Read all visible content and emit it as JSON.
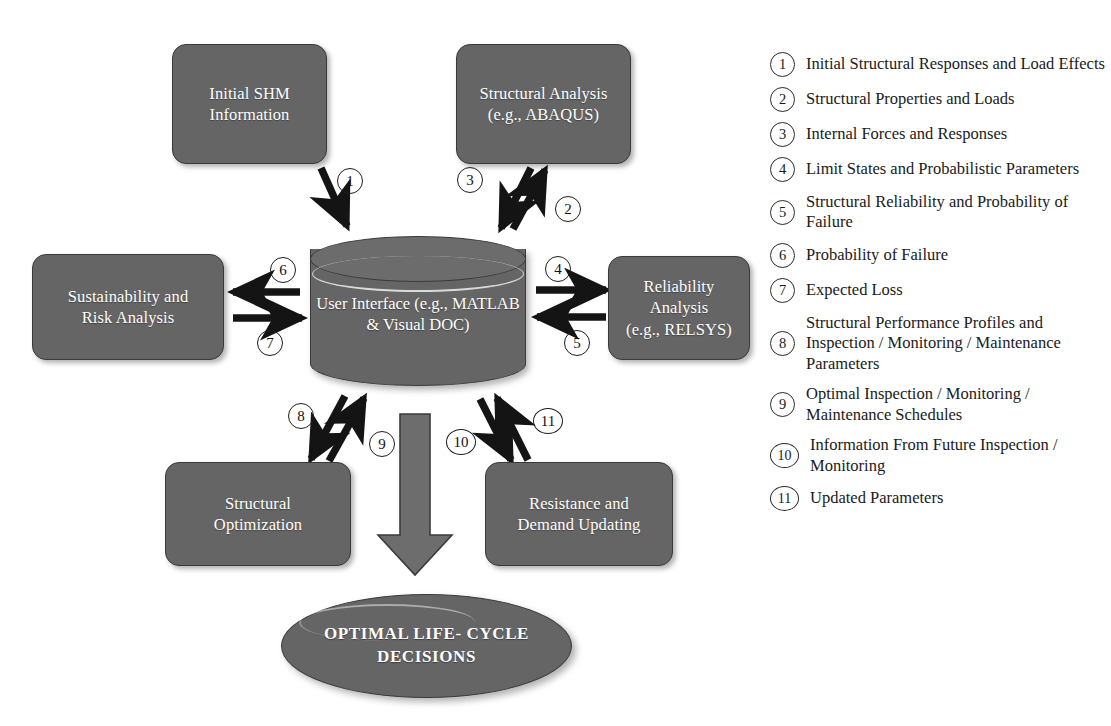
{
  "diagram": {
    "colors": {
      "box_fill": "#656565",
      "box_border": "#3a3a3a",
      "box_text": "#ffffff",
      "arrow": "#141414",
      "big_arrow_fill": "#6d6d6d",
      "legend_text": "#1a1a1a",
      "background": "#ffffff"
    },
    "nodes": [
      {
        "id": "initial-shm-information",
        "shape": "rounded-rect",
        "lines": [
          "Initial SHM",
          "Information"
        ]
      },
      {
        "id": "structural-analysis",
        "shape": "rounded-rect",
        "lines": [
          "Structural Analysis",
          "(e.g., ABAQUS)"
        ]
      },
      {
        "id": "sustainability-and-risk-analysis",
        "shape": "rounded-rect",
        "lines": [
          "Sustainability and",
          "Risk Analysis"
        ]
      },
      {
        "id": "user-interface",
        "shape": "cylinder",
        "lines": [
          "User Interface",
          "(e.g., MATLAB &",
          "Visual DOC)"
        ]
      },
      {
        "id": "reliability-analysis",
        "shape": "rounded-rect",
        "lines": [
          "Reliability",
          "Analysis",
          "(e.g., RELSYS)"
        ]
      },
      {
        "id": "structural-optimization",
        "shape": "rounded-rect",
        "lines": [
          "Structural",
          "Optimization"
        ]
      },
      {
        "id": "resistance-and-demand-updating",
        "shape": "rounded-rect",
        "lines": [
          "Resistance and",
          "Demand Updating"
        ]
      },
      {
        "id": "optimal-life-cycle-decisions",
        "shape": "ellipse",
        "lines": [
          "OPTIMAL  LIFE-",
          "CYCLE  DECISIONS"
        ]
      }
    ],
    "arrow_markers": [
      "1",
      "2",
      "3",
      "4",
      "5",
      "6",
      "7",
      "8",
      "9",
      "10",
      "11"
    ],
    "edges": [
      {
        "marker": "1",
        "from": "initial-shm-information",
        "to": "user-interface"
      },
      {
        "marker": "2",
        "from": "user-interface",
        "to": "structural-analysis"
      },
      {
        "marker": "3",
        "from": "structural-analysis",
        "to": "user-interface"
      },
      {
        "marker": "4",
        "from": "user-interface",
        "to": "reliability-analysis"
      },
      {
        "marker": "5",
        "from": "reliability-analysis",
        "to": "user-interface"
      },
      {
        "marker": "6",
        "from": "user-interface",
        "to": "sustainability-and-risk-analysis"
      },
      {
        "marker": "7",
        "from": "sustainability-and-risk-analysis",
        "to": "user-interface"
      },
      {
        "marker": "8",
        "from": "user-interface",
        "to": "structural-optimization"
      },
      {
        "marker": "9",
        "from": "structural-optimization",
        "to": "user-interface"
      },
      {
        "marker": "10",
        "from": "user-interface",
        "to": "resistance-and-demand-updating"
      },
      {
        "marker": "11",
        "from": "resistance-and-demand-updating",
        "to": "user-interface"
      },
      {
        "marker": "",
        "from": "user-interface",
        "to": "optimal-life-cycle-decisions"
      }
    ]
  },
  "legend": {
    "items": [
      {
        "num": "1",
        "text": "Initial Structural Responses and Load Effects"
      },
      {
        "num": "2",
        "text": "Structural Properties and Loads"
      },
      {
        "num": "3",
        "text": "Internal Forces and Responses"
      },
      {
        "num": "4",
        "text": "Limit States and Probabilistic Parameters"
      },
      {
        "num": "5",
        "text": "Structural Reliability and Probability of Failure"
      },
      {
        "num": "6",
        "text": "Probability of Failure"
      },
      {
        "num": "7",
        "text": "Expected Loss"
      },
      {
        "num": "8",
        "text": "Structural Performance Profiles and Inspection / Monitoring / Maintenance Parameters"
      },
      {
        "num": "9",
        "text": "Optimal Inspection / Monitoring / Maintenance Schedules"
      },
      {
        "num": "10",
        "text": "Information From Future Inspection / Monitoring"
      },
      {
        "num": "11",
        "text": "Updated Parameters"
      }
    ]
  }
}
